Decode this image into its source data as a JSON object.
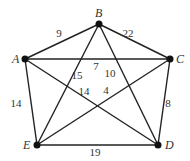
{
  "graph": {
    "nodes": [
      {
        "id": "A",
        "label": "A",
        "x": 25,
        "y": 59,
        "lx": 12,
        "ly": 63
      },
      {
        "id": "B",
        "label": "B",
        "x": 99,
        "y": 24,
        "lx": 95,
        "ly": 17
      },
      {
        "id": "C",
        "label": "C",
        "x": 170,
        "y": 59,
        "lx": 176,
        "ly": 63
      },
      {
        "id": "D",
        "label": "D",
        "x": 158,
        "y": 145,
        "lx": 165,
        "ly": 149
      },
      {
        "id": "E",
        "label": "E",
        "x": 37,
        "y": 145,
        "lx": 23,
        "ly": 149
      }
    ],
    "edges": [
      {
        "from": "A",
        "to": "B",
        "weight": "9",
        "lx": 59,
        "ly": 37
      },
      {
        "from": "B",
        "to": "C",
        "weight": "22",
        "lx": 128,
        "ly": 37
      },
      {
        "from": "A",
        "to": "C",
        "weight": "7",
        "lx": 96,
        "ly": 70
      },
      {
        "from": "B",
        "to": "E",
        "weight": "15",
        "lx": 77,
        "ly": 79
      },
      {
        "from": "B",
        "to": "D",
        "weight": "10",
        "lx": 110,
        "ly": 77
      },
      {
        "from": "A",
        "to": "D",
        "weight": "14",
        "lx": 84,
        "ly": 95
      },
      {
        "from": "C",
        "to": "E",
        "weight": "4",
        "lx": 106,
        "ly": 94
      },
      {
        "from": "A",
        "to": "E",
        "weight": "14",
        "lx": 16,
        "ly": 107
      },
      {
        "from": "C",
        "to": "D",
        "weight": "8",
        "lx": 168,
        "ly": 107
      },
      {
        "from": "E",
        "to": "D",
        "weight": "19",
        "lx": 95,
        "ly": 156
      }
    ]
  }
}
